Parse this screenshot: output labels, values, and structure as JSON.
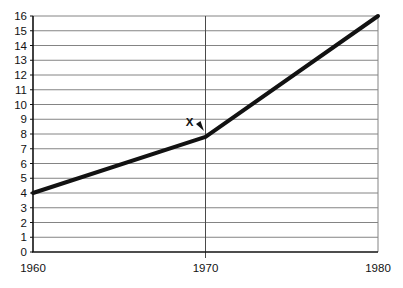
{
  "chart_data": {
    "type": "line",
    "title": "",
    "xlabel": "",
    "ylabel": "",
    "x": [
      1960,
      1970,
      1980
    ],
    "series": [
      {
        "name": "line",
        "values": [
          4,
          7.8,
          16
        ]
      }
    ],
    "xlim": [
      1960,
      1980
    ],
    "ylim": [
      0,
      16
    ],
    "x_ticks": [
      "1960",
      "1970",
      "1980"
    ],
    "y_ticks": [
      0,
      1,
      2,
      3,
      4,
      5,
      6,
      7,
      8,
      9,
      10,
      11,
      12,
      13,
      14,
      15,
      16
    ],
    "grid": {
      "horizontal": "line at every y tick",
      "vertical_lines_at": [
        1970
      ]
    },
    "legend": "none",
    "annotation": {
      "label": "X",
      "points_at_x": 1970,
      "points_at_y": 7.8
    },
    "colors": {
      "line": "#121212",
      "grid": "#848484",
      "vertical_grid": "#4a4a4a",
      "axis": "#121212",
      "text": "#121212",
      "background": "#ffffff"
    }
  }
}
